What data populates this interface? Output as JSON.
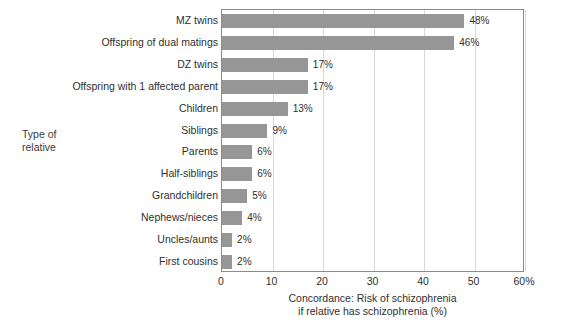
{
  "chart_data": {
    "type": "bar",
    "orientation": "horizontal",
    "title": "",
    "xlabel": "Concordance: Risk of schizophrenia\nif relative has schizophrenia (%)",
    "ylabel": "Type of\nrelative",
    "xlim": [
      0,
      60
    ],
    "xticks": [
      0,
      10,
      20,
      30,
      40,
      50,
      60
    ],
    "xtick_labels": [
      "0",
      "10",
      "20",
      "30",
      "40",
      "50",
      "60%"
    ],
    "grid": true,
    "legend": "none",
    "bar_color": "#969696",
    "categories": [
      "MZ twins",
      "Offspring of dual matings",
      "DZ twins",
      "Offspring with 1 affected parent",
      "Children",
      "Siblings",
      "Parents",
      "Half-siblings",
      "Grandchildren",
      "Nephews/nieces",
      "Uncles/aunts",
      "First cousins"
    ],
    "values": [
      48,
      46,
      17,
      17,
      13,
      9,
      6,
      6,
      5,
      4,
      2,
      2
    ],
    "value_labels": [
      "48%",
      "46%",
      "17%",
      "17%",
      "13%",
      "9%",
      "6%",
      "6%",
      "5%",
      "4%",
      "2%",
      "2%"
    ]
  }
}
